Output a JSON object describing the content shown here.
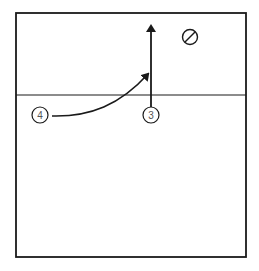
{
  "diagram": {
    "type": "volleyball-play",
    "court": {
      "frame": [
        16,
        13,
        246,
        257
      ],
      "net_y": 95,
      "color": "#1a1a1a"
    },
    "players": [
      {
        "id": "p4",
        "label": "4",
        "x": 40,
        "y": 115
      },
      {
        "id": "p3",
        "label": "3",
        "x": 151,
        "y": 115
      }
    ],
    "markers": [
      {
        "id": "setter-null",
        "symbol": "⊘",
        "x": 190,
        "y": 37
      }
    ],
    "movements": [
      {
        "from": "p3",
        "type": "straight",
        "path": "up to y=25"
      },
      {
        "from": "p4",
        "type": "curved",
        "path": "toward (149,74)"
      }
    ]
  }
}
